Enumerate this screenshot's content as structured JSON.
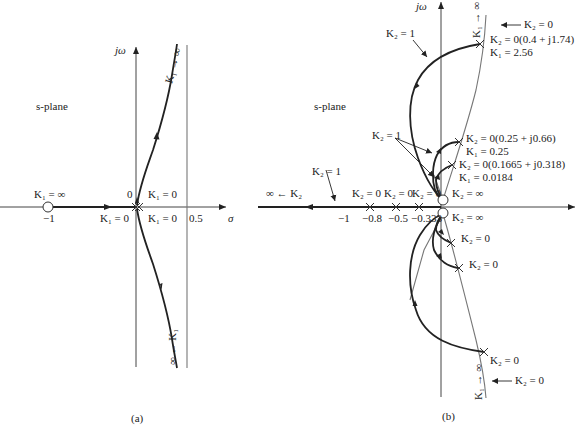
{
  "figure": {
    "panel_a": {
      "caption": "(a)",
      "plane_label": "s-plane",
      "axes": {
        "imag_label": "jω",
        "real_label": "σ"
      },
      "ticks": {
        "minus_one": "−1",
        "origin": "0",
        "asymptote": "0.5"
      },
      "labels": {
        "zero_k_inf": "K₁ = ∞",
        "k1_zero_upper": "K₁ = 0",
        "k1_zero_left": "K₁ = 0",
        "k1_zero_lower": "K₁ = 0",
        "upper_branch": "K₁ → ∞",
        "lower_branch": "∞ ← K₁"
      },
      "zeros": [
        -1
      ],
      "poles": [
        0,
        0
      ],
      "asymptote_sigma": 0.5
    },
    "panel_b": {
      "caption": "(b)",
      "plane_label": "s-plane",
      "axes": {
        "imag_label": "jω"
      },
      "ticks": {
        "minus_one": "−1",
        "p08": "−0.8",
        "p05": "−0.5",
        "p0333": "−0.333"
      },
      "labels": {
        "k2_one_top": "K₂ = 1",
        "k2_one_mid": "K₂ = 1",
        "k2_one_axis": "K₂ = 1",
        "k2_inf_left": "∞ ← K₂",
        "k2_zero_p08": "K₂ = 0",
        "k2_zero_p05": "K₂ = 0",
        "k2_zero_p0333": "K₂ = 0",
        "k2_inf_upper": "K₂ = ∞",
        "k2_inf_lower": "K₂ = ∞",
        "k2_zero_arrow_top": "K₂ = 0",
        "k2_zero_arrow_bottom": "K₂ = 0",
        "k1_inf_top": "K₁ → ∞",
        "k1_inf_bottom": "K₁ → ∞",
        "pt1_a": "K₂ = 0(0.4 + j1.74)",
        "pt1_b": "K₁ = 2.56",
        "pt2_a": "K₂ = 0(0.25 + j0.66)",
        "pt2_b": "K₁ = 0.25",
        "pt3_a": "K₂ = 0(0.1665 + j0.318)",
        "pt3_b": "K₁ = 0.0184",
        "lower_pole_1": "K₂ = 0",
        "lower_pole_2": "K₂ = 0",
        "lower_pole_3": "K₂ = 0"
      },
      "k1_points": [
        {
          "K1": 2.56,
          "pole": "0.4 ± j1.74"
        },
        {
          "K1": 0.25,
          "pole": "0.25 ± j0.66"
        },
        {
          "K1": 0.0184,
          "pole": "0.1665 ± j0.318"
        }
      ],
      "real_axis_poles": [
        -0.8,
        -0.5,
        -0.333
      ],
      "zeros": [
        0,
        0
      ]
    }
  }
}
